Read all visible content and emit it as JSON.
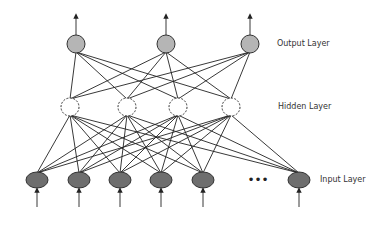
{
  "diagram": {
    "type": "neural-network",
    "labels": {
      "output": "Output Layer",
      "hidden": "Hidden Layer",
      "input": "Input Layer"
    },
    "layers": {
      "output": {
        "count": 3,
        "x": [
          76,
          166,
          250
        ],
        "y": 44,
        "fill": "#b5b5b5",
        "style": "solid"
      },
      "hidden": {
        "count": 4,
        "x": [
          70,
          127,
          178,
          231
        ],
        "y": 107,
        "fill": "#ffffff",
        "style": "dashed"
      },
      "input": {
        "count": 6,
        "x": [
          37,
          79,
          120,
          161,
          203,
          299
        ],
        "y": 180,
        "fill": "#6e6e6e",
        "style": "solid",
        "ellipsis": "•••"
      }
    },
    "connections": "fully-connected"
  }
}
